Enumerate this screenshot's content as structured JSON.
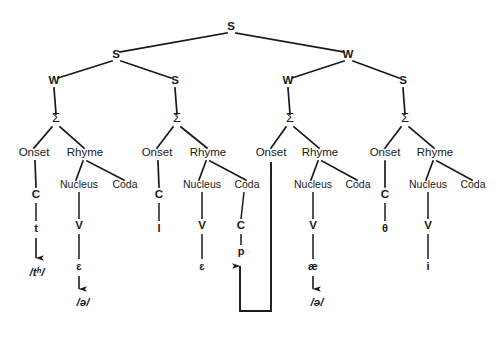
{
  "diagram": {
    "stroke_color": "#1a1a1a",
    "background_color": "#ffffff",
    "labels": {
      "strong": "S",
      "weak": "W",
      "foot": "Σ",
      "onset": "Onset",
      "rhyme": "Rhyme",
      "nucleus": "Nucleus",
      "coda": "Coda",
      "consonant": "C",
      "vowel": "V"
    },
    "grid": {
      "root": {
        "label": "S",
        "x": 231,
        "y": 30
      },
      "level2": [
        {
          "label": "S",
          "x": 116,
          "y": 58
        },
        {
          "label": "W",
          "x": 348,
          "y": 58
        }
      ],
      "level3": [
        {
          "label": "W",
          "x": 54,
          "y": 84
        },
        {
          "label": "S",
          "x": 175,
          "y": 84
        },
        {
          "label": "W",
          "x": 288,
          "y": 84
        },
        {
          "label": "S",
          "x": 403,
          "y": 84
        }
      ]
    },
    "feet": [
      {
        "label": "Σ",
        "x": 56,
        "y": 122
      },
      {
        "label": "Σ",
        "x": 177,
        "y": 122
      },
      {
        "label": "Σ",
        "x": 290,
        "y": 122
      },
      {
        "label": "Σ",
        "x": 405,
        "y": 122
      }
    ],
    "syllables": [
      {
        "id": "syllable-1",
        "onset": {
          "label": "Onset",
          "x": 34,
          "y": 156
        },
        "rhyme": {
          "label": "Rhyme",
          "x": 85,
          "y": 156
        },
        "nucleus": {
          "label": "Nucleus",
          "x": 79,
          "y": 188
        },
        "coda": {
          "label": "Coda",
          "x": 125,
          "y": 188
        },
        "onset_slot": {
          "label": "C",
          "x": 36,
          "y": 194
        },
        "nucleus_slot": {
          "label": "V",
          "x": 79,
          "y": 225
        },
        "coda_slot": null,
        "onset_segment": {
          "label": "t",
          "x": 36,
          "y": 228
        },
        "nucleus_segment": {
          "label": "ɛ",
          "x": 79,
          "y": 266
        },
        "onset_output": {
          "label": "/tʰ/",
          "x": 37,
          "y": 272
        },
        "nucleus_output": {
          "label": "/ə/",
          "x": 83,
          "y": 302
        }
      },
      {
        "id": "syllable-2",
        "onset": {
          "label": "Onset",
          "x": 157,
          "y": 156
        },
        "rhyme": {
          "label": "Rhyme",
          "x": 208,
          "y": 156
        },
        "nucleus": {
          "label": "Nucleus",
          "x": 202,
          "y": 188
        },
        "coda": {
          "label": "Coda",
          "x": 247,
          "y": 188
        },
        "onset_slot": {
          "label": "C",
          "x": 159,
          "y": 194
        },
        "nucleus_slot": {
          "label": "V",
          "x": 202,
          "y": 225
        },
        "coda_slot": {
          "label": "C",
          "x": 241,
          "y": 225
        },
        "onset_segment": {
          "label": "l",
          "x": 159,
          "y": 228
        },
        "nucleus_segment": {
          "label": "ɛ",
          "x": 202,
          "y": 266
        },
        "coda_segment": {
          "label": "p",
          "x": 241,
          "y": 251
        },
        "onset_output": null,
        "nucleus_output": null
      },
      {
        "id": "syllable-3",
        "onset": {
          "label": "Onset",
          "x": 271,
          "y": 156
        },
        "rhyme": {
          "label": "Rhyme",
          "x": 320,
          "y": 156
        },
        "nucleus": {
          "label": "Nucleus",
          "x": 313,
          "y": 188
        },
        "coda": {
          "label": "Coda",
          "x": 358,
          "y": 188
        },
        "onset_slot": null,
        "nucleus_slot": {
          "label": "V",
          "x": 313,
          "y": 225
        },
        "coda_slot": null,
        "onset_segment": null,
        "nucleus_segment": {
          "label": "æ",
          "x": 313,
          "y": 266
        },
        "onset_output": null,
        "nucleus_output": {
          "label": "/ə/",
          "x": 317,
          "y": 302
        }
      },
      {
        "id": "syllable-4",
        "onset": {
          "label": "Onset",
          "x": 385,
          "y": 156
        },
        "rhyme": {
          "label": "Rhyme",
          "x": 435,
          "y": 156
        },
        "nucleus": {
          "label": "Nucleus",
          "x": 428,
          "y": 188
        },
        "coda": {
          "label": "Coda",
          "x": 473,
          "y": 188
        },
        "onset_slot": {
          "label": "C",
          "x": 385,
          "y": 194
        },
        "nucleus_slot": {
          "label": "V",
          "x": 428,
          "y": 225
        },
        "coda_slot": null,
        "onset_segment": {
          "label": "θ",
          "x": 385,
          "y": 228
        },
        "nucleus_segment": {
          "label": "i",
          "x": 428,
          "y": 266
        },
        "onset_output": null,
        "nucleus_output": null
      }
    ],
    "association_line": {
      "name": "resyllabification-link",
      "description": "Line from syllable-3 Onset down and back up to the coda segment p of syllable-2",
      "path": "M 271 162 L 271 311 L 240 311 L 240 262"
    }
  }
}
